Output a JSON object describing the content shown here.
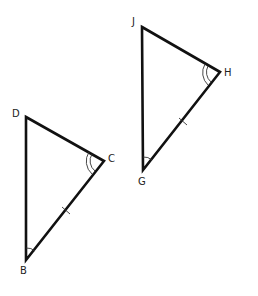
{
  "diagram": {
    "triangles": [
      {
        "name": "DCB",
        "vertices": {
          "D": {
            "label": "D",
            "x": 26,
            "y": 117
          },
          "C": {
            "label": "C",
            "x": 104,
            "y": 161
          },
          "B": {
            "label": "B",
            "x": 26,
            "y": 260
          }
        },
        "marks": {
          "angle_C": "double arc",
          "angle_B": "single arc",
          "side_CB": "single tick"
        }
      },
      {
        "name": "JHG",
        "vertices": {
          "J": {
            "label": "J",
            "x": 142,
            "y": 27
          },
          "H": {
            "label": "H",
            "x": 220,
            "y": 72
          },
          "G": {
            "label": "G",
            "x": 143,
            "y": 170
          }
        },
        "marks": {
          "angle_H": "double arc",
          "angle_G": "single arc",
          "side_HG": "single tick"
        }
      }
    ],
    "labels": {
      "D": "D",
      "C": "C",
      "B": "B",
      "J": "J",
      "H": "H",
      "G": "G"
    },
    "stroke_color": "#111111"
  }
}
